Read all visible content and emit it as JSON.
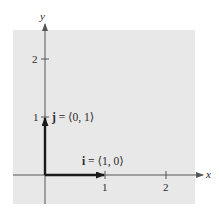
{
  "diagram": {
    "colors": {
      "background": "#ffffff",
      "panel": "#e8e8e8",
      "axis": "#555555",
      "vector": "#1a1a1a",
      "text": "#2a2a2a"
    },
    "axes": {
      "x_label": "x",
      "y_label": "y",
      "x_ticks": [
        "1",
        "2"
      ],
      "y_ticks": [
        "1",
        "2"
      ]
    },
    "vectors": [
      {
        "name": "i",
        "label_bold": "i",
        "label_rest": " = ⟨1, 0⟩",
        "from": [
          0,
          0
        ],
        "to": [
          1,
          0
        ]
      },
      {
        "name": "j",
        "label_bold": "j",
        "label_rest": " = ⟨0, 1⟩",
        "from": [
          0,
          0
        ],
        "to": [
          0,
          1
        ]
      }
    ]
  }
}
